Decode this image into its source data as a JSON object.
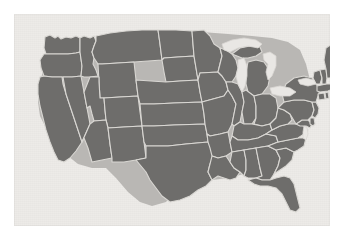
{
  "image": {
    "title": "Contiguous United States state map",
    "kind": "thematic-map",
    "width": 343,
    "height": 238
  },
  "panel": {
    "background_color": "#edebe8",
    "border_color": "#e6e4e1",
    "outer_margin_color": "#ffffff",
    "left": 14,
    "top": 14,
    "width": 316,
    "height": 212
  },
  "map": {
    "name": "united-states-contiguous",
    "projection_hint": "albers-usa",
    "fill_color": "#6e6d6b",
    "border_color": "#d9d7d3",
    "lake_color": "#e9e7e4",
    "shadow_color": "#b9b7b4",
    "region_count": 49,
    "regions": [
      {
        "code": "WA",
        "name": "Washington"
      },
      {
        "code": "OR",
        "name": "Oregon"
      },
      {
        "code": "CA",
        "name": "California"
      },
      {
        "code": "NV",
        "name": "Nevada"
      },
      {
        "code": "ID",
        "name": "Idaho"
      },
      {
        "code": "MT",
        "name": "Montana"
      },
      {
        "code": "WY",
        "name": "Wyoming"
      },
      {
        "code": "UT",
        "name": "Utah"
      },
      {
        "code": "AZ",
        "name": "Arizona"
      },
      {
        "code": "NM",
        "name": "New Mexico"
      },
      {
        "code": "CO",
        "name": "Colorado"
      },
      {
        "code": "ND",
        "name": "North Dakota"
      },
      {
        "code": "SD",
        "name": "South Dakota"
      },
      {
        "code": "NE",
        "name": "Nebraska"
      },
      {
        "code": "KS",
        "name": "Kansas"
      },
      {
        "code": "OK",
        "name": "Oklahoma"
      },
      {
        "code": "TX",
        "name": "Texas"
      },
      {
        "code": "MN",
        "name": "Minnesota"
      },
      {
        "code": "IA",
        "name": "Iowa"
      },
      {
        "code": "MO",
        "name": "Missouri"
      },
      {
        "code": "AR",
        "name": "Arkansas"
      },
      {
        "code": "LA",
        "name": "Louisiana"
      },
      {
        "code": "WI",
        "name": "Wisconsin"
      },
      {
        "code": "IL",
        "name": "Illinois"
      },
      {
        "code": "MI",
        "name": "Michigan"
      },
      {
        "code": "IN",
        "name": "Indiana"
      },
      {
        "code": "OH",
        "name": "Ohio"
      },
      {
        "code": "KY",
        "name": "Kentucky"
      },
      {
        "code": "TN",
        "name": "Tennessee"
      },
      {
        "code": "MS",
        "name": "Mississippi"
      },
      {
        "code": "AL",
        "name": "Alabama"
      },
      {
        "code": "GA",
        "name": "Georgia"
      },
      {
        "code": "FL",
        "name": "Florida"
      },
      {
        "code": "SC",
        "name": "South Carolina"
      },
      {
        "code": "NC",
        "name": "North Carolina"
      },
      {
        "code": "VA",
        "name": "Virginia"
      },
      {
        "code": "WV",
        "name": "West Virginia"
      },
      {
        "code": "MD",
        "name": "Maryland"
      },
      {
        "code": "DE",
        "name": "Delaware"
      },
      {
        "code": "PA",
        "name": "Pennsylvania"
      },
      {
        "code": "NJ",
        "name": "New Jersey"
      },
      {
        "code": "NY",
        "name": "New York"
      },
      {
        "code": "CT",
        "name": "Connecticut"
      },
      {
        "code": "RI",
        "name": "Rhode Island"
      },
      {
        "code": "MA",
        "name": "Massachusetts"
      },
      {
        "code": "VT",
        "name": "Vermont"
      },
      {
        "code": "NH",
        "name": "New Hampshire"
      },
      {
        "code": "ME",
        "name": "Maine"
      },
      {
        "code": "DC",
        "name": "District of Columbia"
      }
    ],
    "water_bodies": [
      {
        "name": "Lake Superior"
      },
      {
        "name": "Lake Michigan"
      },
      {
        "name": "Lake Huron"
      },
      {
        "name": "Lake Erie"
      },
      {
        "name": "Lake Ontario"
      },
      {
        "name": "Chesapeake Bay"
      }
    ]
  }
}
